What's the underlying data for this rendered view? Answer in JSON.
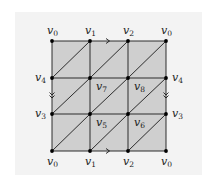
{
  "diagram": {
    "colors": {
      "fill": "#cfcfcf",
      "stroke": "#1a1a1a",
      "vertex": "#000000",
      "panel": "#f3f3f3"
    },
    "grid": {
      "cols_x": [
        52,
        90,
        128,
        166
      ],
      "rows_y": [
        41,
        78,
        114,
        151
      ]
    },
    "vertex_grid": [
      [
        "v0",
        "v1",
        "v2",
        "v0"
      ],
      [
        "v4",
        "v7",
        "v8",
        "v4"
      ],
      [
        "v3",
        "v5",
        "v6",
        "v3"
      ],
      [
        "v0",
        "v1",
        "v2",
        "v0"
      ]
    ],
    "labels": {
      "top": [
        {
          "base": "v",
          "sub": "0"
        },
        {
          "base": "v",
          "sub": "1"
        },
        {
          "base": "v",
          "sub": "2"
        },
        {
          "base": "v",
          "sub": "0"
        }
      ],
      "bottom": [
        {
          "base": "v",
          "sub": "0"
        },
        {
          "base": "v",
          "sub": "1"
        },
        {
          "base": "v",
          "sub": "2"
        },
        {
          "base": "v",
          "sub": "0"
        }
      ],
      "left": [
        {
          "base": "v",
          "sub": "4"
        },
        {
          "base": "v",
          "sub": "3"
        }
      ],
      "right": [
        {
          "base": "v",
          "sub": "4"
        },
        {
          "base": "v",
          "sub": "3"
        }
      ],
      "interior": [
        {
          "base": "v",
          "sub": "7"
        },
        {
          "base": "v",
          "sub": "8"
        },
        {
          "base": "v",
          "sub": "5"
        },
        {
          "base": "v",
          "sub": "6"
        }
      ]
    },
    "edge_markers": {
      "horizontal": "single-arrow-right",
      "vertical": "double-arrow-down"
    },
    "diagonal_direction": "bottom-left-to-top-right"
  }
}
